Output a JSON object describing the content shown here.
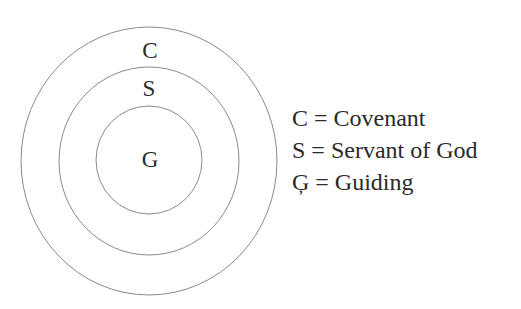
{
  "diagram": {
    "type": "concentric-circles",
    "stroke_color": "#8a8a8a",
    "rings": [
      {
        "label": "C",
        "cx": 149,
        "cy": 161,
        "rx": 128,
        "ry": 134
      },
      {
        "label": "S",
        "cx": 149,
        "cy": 161,
        "rx": 90,
        "ry": 94
      },
      {
        "label": "G",
        "cx": 149,
        "cy": 160,
        "rx": 53,
        "ry": 54
      }
    ]
  },
  "legend": {
    "items": [
      {
        "text": "C = Covenant"
      },
      {
        "text": "S = Servant of God"
      },
      {
        "text": "Ģ = Guiding"
      }
    ]
  }
}
